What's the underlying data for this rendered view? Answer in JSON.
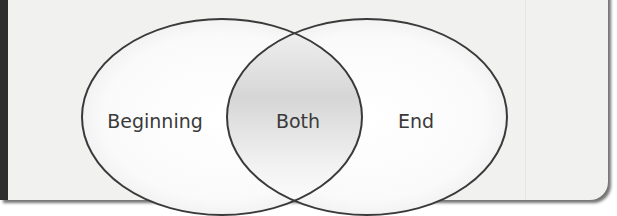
{
  "diagram": {
    "type": "venn",
    "sets": [
      {
        "id": "left",
        "label": "Beginning"
      },
      {
        "id": "right",
        "label": "End"
      }
    ],
    "intersection": {
      "label": "Both"
    }
  },
  "colors": {
    "panel_background": "#f1f1f0",
    "spine": "#2e2e2e",
    "outline": "#3a3a3a",
    "text": "#3a3a3a"
  }
}
